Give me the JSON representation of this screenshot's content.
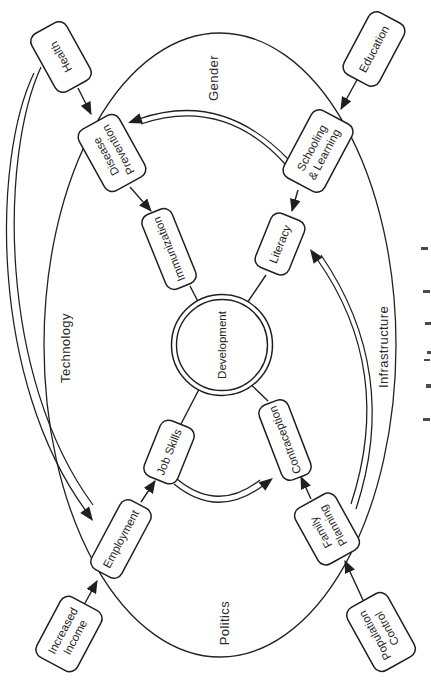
{
  "nodes": {
    "development": {
      "label": "Development"
    },
    "health": {
      "label": "Health"
    },
    "disease_prevention": {
      "line1": "Disease",
      "line2": "Prevention"
    },
    "immunization": {
      "label": "Immunization"
    },
    "education": {
      "label": "Education"
    },
    "schooling_learning": {
      "line1": "Schooling",
      "line2": "& Learning"
    },
    "literacy": {
      "label": "Literacy"
    },
    "increased_income": {
      "line1": "Increased",
      "line2": "Income"
    },
    "employment": {
      "label": "Employment"
    },
    "job_skills": {
      "label": "Job Skills"
    },
    "population_control": {
      "line1": "Population",
      "line2": "Control"
    },
    "family_planning": {
      "line1": "Family",
      "line2": "Planning"
    },
    "contraception": {
      "label": "Contraception"
    }
  },
  "context_labels": {
    "gender": "Gender",
    "technology": "Technology",
    "infrastructure": "Infrastructure",
    "politics": "Politics"
  },
  "edges": [
    {
      "from": "Health",
      "to": "Disease Prevention",
      "type": "arrow"
    },
    {
      "from": "Disease Prevention",
      "to": "Immunization",
      "type": "arrow"
    },
    {
      "from": "Immunization",
      "to": "Development",
      "type": "arrow"
    },
    {
      "from": "Education",
      "to": "Schooling & Learning",
      "type": "arrow"
    },
    {
      "from": "Schooling & Learning",
      "to": "Literacy",
      "type": "arrow"
    },
    {
      "from": "Literacy",
      "to": "Development",
      "type": "arrow"
    },
    {
      "from": "Increased Income",
      "to": "Employment",
      "type": "arrow"
    },
    {
      "from": "Employment",
      "to": "Job Skills",
      "type": "arrow"
    },
    {
      "from": "Job Skills",
      "to": "Development",
      "type": "arrow"
    },
    {
      "from": "Population Control",
      "to": "Family Planning",
      "type": "arrow"
    },
    {
      "from": "Family Planning",
      "to": "Contraception",
      "type": "arrow"
    },
    {
      "from": "Contraception",
      "to": "Development",
      "type": "arrow"
    },
    {
      "from": "Schooling & Learning",
      "to": "Disease Prevention",
      "type": "double-curve"
    },
    {
      "from": "Health",
      "to": "Employment",
      "type": "double-curve"
    },
    {
      "from": "Family Planning",
      "to": "Literacy",
      "type": "double-curve"
    },
    {
      "from": "Job Skills",
      "to": "Contraception",
      "type": "double-curve"
    }
  ],
  "colors": {
    "stroke": "#1f1f1f",
    "fill": "#ffffff",
    "background": "#ffffff"
  }
}
